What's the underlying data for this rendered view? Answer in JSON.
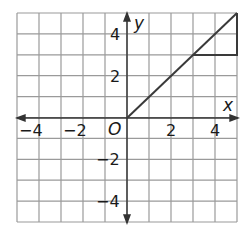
{
  "graph": {
    "x_axis_label": "x",
    "y_axis_label": "y",
    "origin_label": "O",
    "x_ticks": [
      {
        "value": -4,
        "label": "−4"
      },
      {
        "value": -2,
        "label": "−2"
      },
      {
        "value": 2,
        "label": "2"
      },
      {
        "value": 4,
        "label": "4"
      }
    ],
    "y_ticks": [
      {
        "value": 4,
        "label": "4"
      },
      {
        "value": 2,
        "label": "2"
      },
      {
        "value": -2,
        "label": "−2"
      },
      {
        "value": -4,
        "label": "−4"
      }
    ],
    "grid": {
      "xmin": -5,
      "xmax": 5,
      "ymin": -5,
      "ymax": 5,
      "step": 1
    },
    "line": {
      "from": [
        0,
        0
      ],
      "to": [
        5,
        5
      ],
      "color": "#333333"
    },
    "slope_triangle": {
      "points": [
        [
          3,
          3
        ],
        [
          5,
          3
        ],
        [
          5,
          5
        ]
      ],
      "rise": 2,
      "run": 2
    },
    "colors": {
      "grid": "#9a9a9a",
      "axis": "#333333",
      "line": "#3a3a3a"
    }
  }
}
